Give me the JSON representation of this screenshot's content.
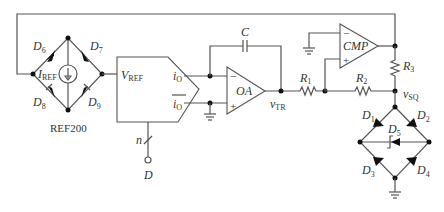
{
  "diagram": {
    "type": "circuit-schematic",
    "components": {
      "ref_source": {
        "name": "REF200",
        "current_label": "I",
        "current_sub": "REF",
        "diodes": [
          "D6",
          "D7",
          "D8",
          "D9"
        ]
      },
      "dac": {
        "vref_label": "V",
        "vref_sub": "REF",
        "out_label": "i",
        "out_sub": "O",
        "outbar_label": "i",
        "outbar_sub": "O",
        "bus_label": "n",
        "input_label": "D"
      },
      "integrator": {
        "opamp_label": "OA",
        "cap_label": "C",
        "out_label": "v",
        "out_sub": "TR"
      },
      "comparator": {
        "label": "CMP"
      },
      "resistors": {
        "r1": {
          "label": "R",
          "sub": "1"
        },
        "r2": {
          "label": "R",
          "sub": "2"
        },
        "r3": {
          "label": "R",
          "sub": "3"
        }
      },
      "output": {
        "label": "v",
        "sub": "SQ"
      },
      "clamp_bridge": {
        "diodes": [
          {
            "label": "D",
            "sub": "1"
          },
          {
            "label": "D",
            "sub": "2"
          },
          {
            "label": "D",
            "sub": "3"
          },
          {
            "label": "D",
            "sub": "4"
          },
          {
            "label": "D",
            "sub": "5"
          }
        ]
      },
      "ref_diodes": [
        {
          "label": "D",
          "sub": "6"
        },
        {
          "label": "D",
          "sub": "7"
        },
        {
          "label": "D",
          "sub": "8"
        },
        {
          "label": "D",
          "sub": "9"
        }
      ]
    },
    "signs": {
      "minus": "−",
      "plus": "+"
    }
  }
}
